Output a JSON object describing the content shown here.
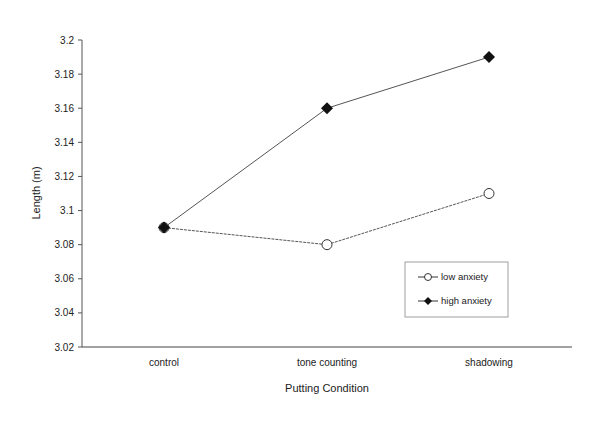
{
  "chart_data": {
    "type": "line",
    "title": "",
    "xlabel": "Putting Condition",
    "ylabel": "Length (m)",
    "categories": [
      "control",
      "tone counting",
      "shadowing"
    ],
    "series": [
      {
        "name": "low anxiety",
        "marker": "open-circle",
        "values": [
          3.09,
          3.08,
          3.11
        ]
      },
      {
        "name": "high anxiety",
        "marker": "filled-diamond",
        "values": [
          3.09,
          3.16,
          3.19
        ]
      }
    ],
    "ylim": [
      3.02,
      3.2
    ],
    "yticks": [
      "3.02",
      "3.04",
      "3.06",
      "3.08",
      "3.1",
      "3.12",
      "3.14",
      "3.16",
      "3.18",
      "3.2"
    ],
    "grid": false,
    "legend_position": "lower right inside"
  },
  "legend": {
    "items": [
      {
        "label": "low anxiety"
      },
      {
        "label": "high anxiety"
      }
    ]
  }
}
